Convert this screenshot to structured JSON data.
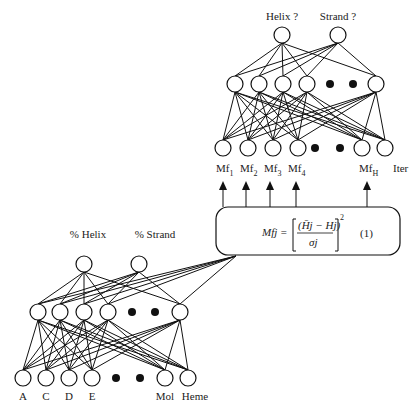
{
  "upper_network": {
    "outputs": [
      "Helix ?",
      "Strand ?"
    ],
    "hidden_count_visible": 5,
    "inputs": [
      {
        "base": "Mf",
        "sub": "1"
      },
      {
        "base": "Mf",
        "sub": "2"
      },
      {
        "base": "Mf",
        "sub": "3"
      },
      {
        "base": "Mf",
        "sub": "4"
      },
      {
        "base": "Mf",
        "sub": "H"
      },
      {
        "base": "Iter",
        "sub": ""
      }
    ]
  },
  "lower_network": {
    "outputs": [
      "% Helix",
      "% Strand"
    ],
    "hidden_count_visible": 5,
    "inputs": [
      "A",
      "C",
      "D",
      "E",
      "Mol",
      "Heme"
    ]
  },
  "equation": {
    "lhs": "Mfj =",
    "numerator": "(H̄j − Hj)",
    "exponent": "2",
    "denominator": "σj",
    "number": "(1)"
  }
}
